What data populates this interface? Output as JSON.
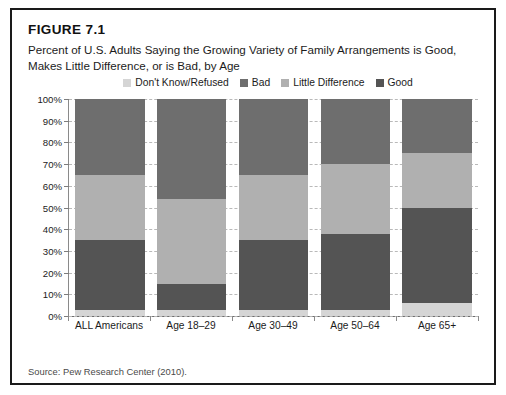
{
  "figure": {
    "label": "FIGURE 7.1",
    "title": "Percent of U.S. Adults Saying the Growing Variety of Family Arrangements is Good, Makes Little Difference, or is Bad, by Age",
    "source": "Source: Pew Research Center (2010)."
  },
  "colors": {
    "dont_know": "#d5d5d5",
    "bad": "#6e6e6e",
    "little_difference": "#b0b0b0",
    "good": "#545454",
    "border": "#1a1a1a",
    "grid": "#b9b9b9",
    "axis": "#7d7d7d"
  },
  "chart_data": {
    "type": "bar",
    "stacked": true,
    "title": "Percent of U.S. Adults Saying the Growing Variety of Family Arrangements is Good, Makes Little Difference, or is Bad, by Age",
    "xlabel": "",
    "ylabel": "",
    "ylim": [
      0,
      100
    ],
    "yticks": [
      "0%",
      "10%",
      "20%",
      "30%",
      "40%",
      "50%",
      "60%",
      "70%",
      "80%",
      "90%",
      "100%"
    ],
    "grid": true,
    "legend_position": "top-center",
    "categories": [
      "ALL Americans",
      "Age 18–29",
      "Age 30–49",
      "Age 50–64",
      "Age 65+"
    ],
    "series": [
      {
        "name": "Don't Know/Refused",
        "color": "#d5d5d5",
        "values": [
          3,
          3,
          3,
          3,
          6
        ]
      },
      {
        "name": "Bad",
        "color": "#6e6e6e",
        "values": [
          35,
          46,
          35,
          30,
          25
        ]
      },
      {
        "name": "Little Difference",
        "color": "#b0b0b0",
        "values": [
          30,
          39,
          30,
          32,
          25
        ]
      },
      {
        "name": "Good",
        "color": "#545454",
        "values": [
          32,
          12,
          32,
          35,
          44
        ]
      }
    ],
    "stack_order_bottom_to_top": [
      "Don't Know/Refused",
      "Good",
      "Little Difference",
      "Bad"
    ],
    "legend": [
      "Don't Know/Refused",
      "Bad",
      "Little Difference",
      "Good"
    ]
  }
}
